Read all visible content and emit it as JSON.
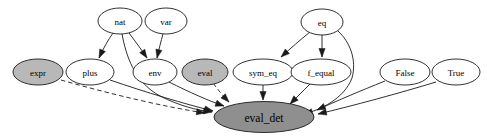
{
  "figure": {
    "kind": "directed-dependency-graph",
    "background_color": "#ffffff",
    "width": 487,
    "height": 140
  },
  "styles": {
    "node_fill_plain": "#ffffff",
    "node_fill_highlight": "#b8b8b8",
    "node_stroke": "#1a1a1a",
    "edge_color": "#1a1a1a",
    "root_node_fill": "#8f8f8f"
  },
  "nodes": [
    {
      "id": "nat",
      "label": "nat",
      "cx": 120,
      "cy": 21,
      "rx": 22,
      "ry": 13,
      "fill": "white",
      "font_size": 9
    },
    {
      "id": "var",
      "label": "var",
      "cx": 166,
      "cy": 21,
      "rx": 21,
      "ry": 13,
      "fill": "white",
      "font_size": 9
    },
    {
      "id": "eq",
      "label": "eq",
      "cx": 322,
      "cy": 22,
      "rx": 21,
      "ry": 13,
      "fill": "white",
      "font_size": 9
    },
    {
      "id": "expr",
      "label": "expr",
      "cx": 38,
      "cy": 72,
      "rx": 25,
      "ry": 13,
      "fill": "gray",
      "font_size": 9
    },
    {
      "id": "plus",
      "label": "plus",
      "cx": 90,
      "cy": 72,
      "rx": 24,
      "ry": 13,
      "fill": "white",
      "font_size": 9
    },
    {
      "id": "env",
      "label": "env",
      "cx": 155,
      "cy": 72,
      "rx": 22,
      "ry": 13,
      "fill": "white",
      "font_size": 9
    },
    {
      "id": "eval",
      "label": "eval",
      "cx": 205,
      "cy": 72,
      "rx": 23,
      "ry": 13,
      "fill": "gray",
      "font_size": 9
    },
    {
      "id": "sym_eq",
      "label": "sym_eq",
      "cx": 263,
      "cy": 72,
      "rx": 30,
      "ry": 13,
      "fill": "white",
      "font_size": 9
    },
    {
      "id": "f_equal",
      "label": "f_equal",
      "cx": 321,
      "cy": 72,
      "rx": 30,
      "ry": 13,
      "fill": "white",
      "font_size": 9
    },
    {
      "id": "False",
      "label": "False",
      "cx": 405,
      "cy": 72,
      "rx": 25,
      "ry": 13,
      "fill": "white",
      "font_size": 9
    },
    {
      "id": "True",
      "label": "True",
      "cx": 456,
      "cy": 72,
      "rx": 24,
      "ry": 13,
      "fill": "white",
      "font_size": 9
    },
    {
      "id": "eval_det",
      "label": "eval_det",
      "cx": 264,
      "cy": 117,
      "rx": 50,
      "ry": 15.5,
      "fill": "root",
      "font_size": 11.5
    }
  ],
  "edges": [
    {
      "from": "nat",
      "to": "plus",
      "style": "solid",
      "arrow": true,
      "path": "M 113,33 C 108,40 103,49 99,58"
    },
    {
      "from": "nat",
      "to": "env",
      "style": "solid",
      "arrow": true,
      "path": "M 129,33 C 135,41 141,49 147,58"
    },
    {
      "from": "nat",
      "to": "eval_det",
      "style": "solid",
      "arrow": true,
      "path": "M 122,34 C 126,55 134,82 160,96 C 180,106 196,110 212,112"
    },
    {
      "from": "var",
      "to": "env",
      "style": "solid",
      "arrow": true,
      "path": "M 163,34 C 161,41 159,49 157,58"
    },
    {
      "from": "eq",
      "to": "sym_eq",
      "style": "solid",
      "arrow": true,
      "path": "M 310,32 C 300,40 291,48 281,57"
    },
    {
      "from": "eq",
      "to": "f_equal",
      "style": "solid",
      "arrow": true,
      "path": "M 322,35 L 322,57"
    },
    {
      "from": "eq",
      "to": "eval_det",
      "style": "solid",
      "arrow": true,
      "path": "M 338,31 C 350,42 357,60 352,78 C 344,99 320,110 304,114"
    },
    {
      "from": "expr",
      "to": "eval_det",
      "style": "dashed",
      "arrow": true,
      "path": "M 61,80 C 110,94 165,107 205,113"
    },
    {
      "from": "eval",
      "to": "eval_det",
      "style": "dashed",
      "arrow": true,
      "path": "M 213,83 C 219,91 224,97 229,102"
    },
    {
      "from": "plus",
      "to": "eval_det",
      "style": "solid",
      "arrow": true,
      "path": "M 110,80 C 145,92 185,104 213,111"
    },
    {
      "from": "env",
      "to": "eval_det",
      "style": "solid",
      "arrow": true,
      "path": "M 169,82 C 189,92 209,101 224,106"
    },
    {
      "from": "sym_eq",
      "to": "eval_det",
      "style": "solid",
      "arrow": true,
      "path": "M 263,85 L 263,100"
    },
    {
      "from": "f_equal",
      "to": "eval_det",
      "style": "solid",
      "arrow": true,
      "path": "M 310,84 C 302,92 295,99 290,104"
    },
    {
      "from": "False",
      "to": "eval_det",
      "style": "solid",
      "arrow": true,
      "path": "M 385,81 C 360,91 334,102 317,110"
    },
    {
      "from": "True",
      "to": "eval_det",
      "style": "solid",
      "arrow": true,
      "path": "M 436,82 C 400,93 352,106 318,114"
    }
  ]
}
